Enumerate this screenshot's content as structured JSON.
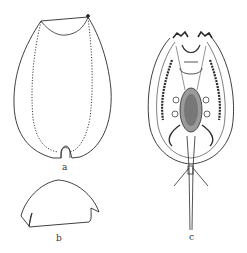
{
  "figure": {
    "panels": [
      {
        "id": "a",
        "label": "a",
        "description": "carapace outline, dorsal view"
      },
      {
        "id": "b",
        "label": "b",
        "description": "head shield outline"
      },
      {
        "id": "c",
        "label": "c",
        "description": "whole animal, ventral view"
      }
    ]
  },
  "colors": {
    "ink": "#2a2a2a",
    "background": "#ffffff"
  }
}
